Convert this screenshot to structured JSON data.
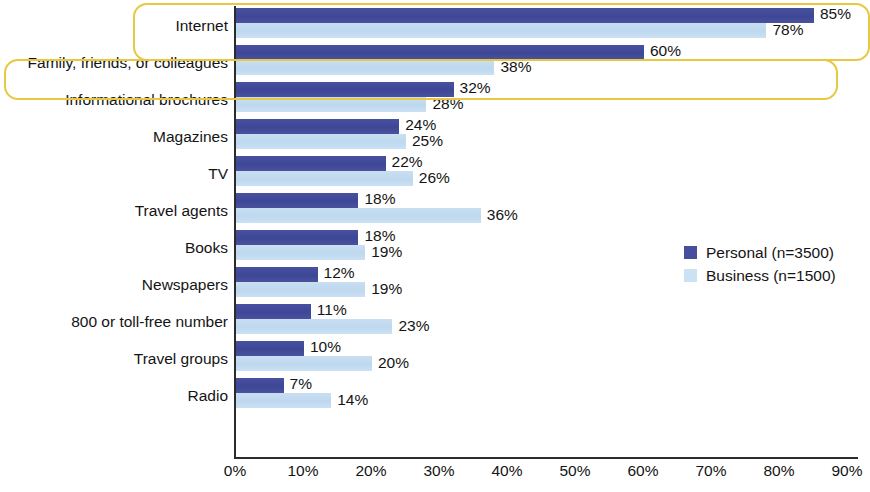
{
  "chart_data": {
    "type": "bar",
    "orientation": "horizontal",
    "title": "",
    "subtitle": "",
    "xlabel": "",
    "ylabel": "",
    "xlim": [
      0,
      90
    ],
    "grid": false,
    "legend_position": "right",
    "categories": [
      "Internet",
      "Family, friends, or colleagues",
      "Informational brochures",
      "Magazines",
      "TV",
      "Travel agents",
      "Books",
      "Newspapers",
      "800 or toll-free number",
      "Travel groups",
      "Radio"
    ],
    "tick_labels": [
      "0%",
      "10%",
      "20%",
      "30%",
      "40%",
      "50%",
      "60%",
      "70%",
      "80%",
      "90%"
    ],
    "tick_values": [
      0,
      10,
      20,
      30,
      40,
      50,
      60,
      70,
      80,
      90
    ],
    "series": [
      {
        "name": "Personal (n=3500)",
        "color": "#3e4795",
        "values": [
          85,
          60,
          32,
          24,
          22,
          18,
          18,
          12,
          11,
          10,
          7
        ],
        "value_labels": [
          "85%",
          "60%",
          "32%",
          "24%",
          "22%",
          "18%",
          "18%",
          "12%",
          "11%",
          "10%",
          "7%"
        ]
      },
      {
        "name": "Business (n=1500)",
        "color": "#cbe1f4",
        "values": [
          78,
          38,
          28,
          25,
          26,
          36,
          19,
          19,
          23,
          20,
          14
        ],
        "value_labels": [
          "78%",
          "38%",
          "28%",
          "25%",
          "26%",
          "36%",
          "19%",
          "19%",
          "23%",
          "20%",
          "14%"
        ]
      }
    ],
    "annotations": [
      {
        "name": "highlight-internet",
        "target_category": "Internet",
        "color": "#e8c742",
        "shape": "rounded-rectangle"
      },
      {
        "name": "highlight-family-friends-colleagues",
        "target_category": "Family, friends, or colleagues",
        "color": "#e8c742",
        "shape": "rounded-rectangle"
      }
    ]
  },
  "legend": {
    "items": [
      {
        "label": "Personal (n=3500)",
        "swatch": "personal"
      },
      {
        "label": "Business (n=1500)",
        "swatch": "business"
      }
    ]
  }
}
